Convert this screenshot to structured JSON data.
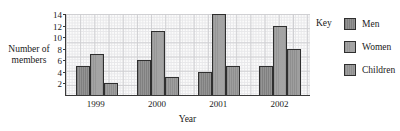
{
  "chart_data": {
    "type": "bar",
    "title": "",
    "xlabel": "Year",
    "ylabel": "Number of members",
    "categories": [
      "1999",
      "2000",
      "2001",
      "2002"
    ],
    "series": [
      {
        "name": "Men",
        "values": [
          5,
          6,
          4,
          5
        ]
      },
      {
        "name": "Women",
        "values": [
          7,
          11,
          14,
          12
        ]
      },
      {
        "name": "Children",
        "values": [
          2,
          3,
          5,
          8
        ]
      }
    ],
    "ylim": [
      0,
      14
    ],
    "ytick_labels": [
      "2",
      "4",
      "6",
      "8",
      "10",
      "12",
      "14"
    ],
    "ytick_values": [
      2,
      4,
      6,
      8,
      10,
      12,
      14
    ],
    "grid": true,
    "grid_style": "graph-paper",
    "legend_title": "Key",
    "legend_position": "right",
    "colors": {
      "men": "#8e8e8e",
      "women": "#a0a0a0",
      "children": "#9a9a9a",
      "bar_outline": "#2f2f2f",
      "axis": "#3a3a3a",
      "grid_major": "#cfcfd2",
      "grid_minor": "#e8e8ea",
      "plot_background": "#fbfbfb",
      "text": "#1a1a1a"
    }
  },
  "axes": {
    "ylabel_line1": "Number of",
    "ylabel_line2": "members",
    "xlabel": "Year"
  },
  "legend": {
    "title": "Key",
    "items": [
      {
        "label": "Men",
        "key": "men"
      },
      {
        "label": "Women",
        "key": "women"
      },
      {
        "label": "Children",
        "key": "children"
      }
    ]
  }
}
